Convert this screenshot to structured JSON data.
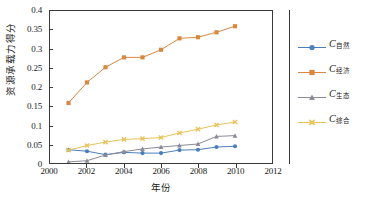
{
  "chart_data": {
    "type": "line",
    "title": "",
    "xlabel": "年份",
    "ylabel": "资源承载力得分",
    "xlim": [
      2000,
      2012
    ],
    "ylim": [
      0,
      0.4
    ],
    "grid": false,
    "legend_position": "right",
    "x": [
      2001,
      2002,
      2003,
      2004,
      2005,
      2006,
      2007,
      2008,
      2009,
      2010
    ],
    "xticks": [
      "2000",
      "2002",
      "2004",
      "2006",
      "2008",
      "2010",
      "2012"
    ],
    "xtick_values": [
      2000,
      2002,
      2004,
      2006,
      2008,
      2010,
      2012
    ],
    "yticks": [
      "0",
      "0.05",
      "0.1",
      "0.15",
      "0.2",
      "0.25",
      "0.3",
      "0.35",
      "0.4"
    ],
    "ytick_values": [
      0,
      0.05,
      0.1,
      0.15,
      0.2,
      0.25,
      0.3,
      0.35,
      0.4
    ],
    "series": [
      {
        "name": "C自然",
        "label_base": "C",
        "label_sub": "自然",
        "color": "#4a7ebb",
        "marker": "circle",
        "values": [
          0.035,
          0.031,
          0.022,
          0.028,
          0.026,
          0.026,
          0.034,
          0.035,
          0.042,
          0.044
        ]
      },
      {
        "name": "C经济",
        "label_base": "C",
        "label_sub": "经济",
        "color": "#d98841",
        "marker": "square",
        "values": [
          0.158,
          0.212,
          0.252,
          0.278,
          0.278,
          0.298,
          0.328,
          0.331,
          0.344,
          0.36
        ]
      },
      {
        "name": "C生态",
        "label_base": "C",
        "label_sub": "生态",
        "color": "#8b8b99",
        "marker": "triangle",
        "values": [
          0.003,
          0.006,
          0.021,
          0.03,
          0.037,
          0.042,
          0.046,
          0.05,
          0.07,
          0.072
        ]
      },
      {
        "name": "C综合",
        "label_base": "C",
        "label_sub": "综合",
        "color": "#e8c25a",
        "marker": "cross",
        "values": [
          0.034,
          0.046,
          0.055,
          0.062,
          0.064,
          0.067,
          0.079,
          0.089,
          0.1,
          0.108
        ]
      }
    ]
  }
}
